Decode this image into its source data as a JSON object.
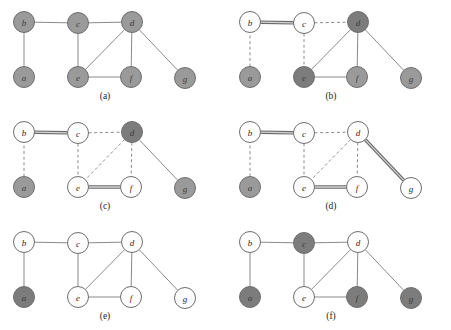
{
  "figure": {
    "panel_count": 6,
    "colors": {
      "node_gray_light": "#9a9a9a",
      "node_gray_dark": "#7c7c7c",
      "node_white": "#fdfdfd",
      "node_border": "#6e6e6e",
      "edge": "#8a8a8a",
      "bold_edge_outer": "#6a6a6a",
      "bold_edge_inner": "#d4d4d4",
      "text": "#242424",
      "background": "#ffffff"
    },
    "node_radius": 10.5,
    "layout": {
      "a": {
        "x": 24,
        "y": 77
      },
      "b": {
        "x": 24,
        "y": 22
      },
      "c": {
        "x": 78,
        "y": 23
      },
      "d": {
        "x": 132,
        "y": 22
      },
      "e": {
        "x": 78,
        "y": 77
      },
      "f": {
        "x": 131,
        "y": 77
      },
      "g": {
        "x": 185,
        "y": 78
      }
    },
    "edge_list": [
      [
        "b",
        "c"
      ],
      [
        "c",
        "d"
      ],
      [
        "a",
        "b"
      ],
      [
        "c",
        "e"
      ],
      [
        "d",
        "e"
      ],
      [
        "d",
        "f"
      ],
      [
        "d",
        "g"
      ],
      [
        "e",
        "f"
      ]
    ],
    "caption_position": {
      "x": 105,
      "y": 99
    }
  },
  "panels": [
    {
      "id": "panel-a",
      "caption": "(a)",
      "origin": {
        "x": 0,
        "y": 0
      },
      "nodes": [
        {
          "id": "a",
          "label": "a",
          "fill": "gray-light"
        },
        {
          "id": "b",
          "label": "b",
          "fill": "gray-light"
        },
        {
          "id": "c",
          "label": "c",
          "fill": "gray-light"
        },
        {
          "id": "d",
          "label": "d",
          "fill": "gray-light"
        },
        {
          "id": "e",
          "label": "e",
          "fill": "gray-light"
        },
        {
          "id": "f",
          "label": "f",
          "fill": "gray-light"
        },
        {
          "id": "g",
          "label": "g",
          "fill": "gray-light"
        }
      ],
      "edges": [
        {
          "from": "b",
          "to": "c",
          "style": "solid"
        },
        {
          "from": "c",
          "to": "d",
          "style": "solid"
        },
        {
          "from": "a",
          "to": "b",
          "style": "solid"
        },
        {
          "from": "c",
          "to": "e",
          "style": "solid"
        },
        {
          "from": "d",
          "to": "e",
          "style": "solid"
        },
        {
          "from": "d",
          "to": "f",
          "style": "solid"
        },
        {
          "from": "d",
          "to": "g",
          "style": "solid"
        },
        {
          "from": "e",
          "to": "f",
          "style": "solid"
        }
      ]
    },
    {
      "id": "panel-b",
      "caption": "(b)",
      "origin": {
        "x": 226,
        "y": 0
      },
      "nodes": [
        {
          "id": "a",
          "label": "a",
          "fill": "gray-light"
        },
        {
          "id": "b",
          "label": "b",
          "fill": "white"
        },
        {
          "id": "c",
          "label": "c",
          "fill": "white"
        },
        {
          "id": "d",
          "label": "d",
          "fill": "gray-dark"
        },
        {
          "id": "e",
          "label": "e",
          "fill": "gray-dark"
        },
        {
          "id": "f",
          "label": "f",
          "fill": "gray-light"
        },
        {
          "id": "g",
          "label": "g",
          "fill": "gray-light"
        }
      ],
      "edges": [
        {
          "from": "b",
          "to": "c",
          "style": "bold"
        },
        {
          "from": "c",
          "to": "d",
          "style": "dashed"
        },
        {
          "from": "a",
          "to": "b",
          "style": "dashed"
        },
        {
          "from": "c",
          "to": "e",
          "style": "dashed"
        },
        {
          "from": "d",
          "to": "e",
          "style": "solid"
        },
        {
          "from": "d",
          "to": "f",
          "style": "solid"
        },
        {
          "from": "d",
          "to": "g",
          "style": "solid"
        },
        {
          "from": "e",
          "to": "f",
          "style": "solid"
        }
      ]
    },
    {
      "id": "panel-c",
      "caption": "(c)",
      "origin": {
        "x": 0,
        "y": 110
      },
      "nodes": [
        {
          "id": "a",
          "label": "a",
          "fill": "gray-light"
        },
        {
          "id": "b",
          "label": "b",
          "fill": "white"
        },
        {
          "id": "c",
          "label": "c",
          "fill": "white"
        },
        {
          "id": "d",
          "label": "d",
          "fill": "gray-dark"
        },
        {
          "id": "e",
          "label": "e",
          "fill": "white"
        },
        {
          "id": "f",
          "label": "f",
          "fill": "white"
        },
        {
          "id": "g",
          "label": "g",
          "fill": "gray-light"
        }
      ],
      "edges": [
        {
          "from": "b",
          "to": "c",
          "style": "bold"
        },
        {
          "from": "c",
          "to": "d",
          "style": "dashed"
        },
        {
          "from": "a",
          "to": "b",
          "style": "dashed"
        },
        {
          "from": "c",
          "to": "e",
          "style": "dashed"
        },
        {
          "from": "d",
          "to": "e",
          "style": "dashed"
        },
        {
          "from": "d",
          "to": "f",
          "style": "dashed"
        },
        {
          "from": "d",
          "to": "g",
          "style": "solid"
        },
        {
          "from": "e",
          "to": "f",
          "style": "bold"
        }
      ]
    },
    {
      "id": "panel-d",
      "caption": "(d)",
      "origin": {
        "x": 226,
        "y": 110
      },
      "nodes": [
        {
          "id": "a",
          "label": "a",
          "fill": "gray-light"
        },
        {
          "id": "b",
          "label": "b",
          "fill": "white"
        },
        {
          "id": "c",
          "label": "c",
          "fill": "white"
        },
        {
          "id": "d",
          "label": "d",
          "fill": "white"
        },
        {
          "id": "e",
          "label": "e",
          "fill": "white"
        },
        {
          "id": "f",
          "label": "f",
          "fill": "white"
        },
        {
          "id": "g",
          "label": "g",
          "fill": "white"
        }
      ],
      "edges": [
        {
          "from": "b",
          "to": "c",
          "style": "bold"
        },
        {
          "from": "c",
          "to": "d",
          "style": "dashed"
        },
        {
          "from": "a",
          "to": "b",
          "style": "dashed"
        },
        {
          "from": "c",
          "to": "e",
          "style": "dashed"
        },
        {
          "from": "d",
          "to": "e",
          "style": "dashed"
        },
        {
          "from": "d",
          "to": "f",
          "style": "dashed"
        },
        {
          "from": "d",
          "to": "g",
          "style": "bold"
        },
        {
          "from": "e",
          "to": "f",
          "style": "bold"
        }
      ]
    },
    {
      "id": "panel-e",
      "caption": "(e)",
      "origin": {
        "x": 0,
        "y": 220
      },
      "nodes": [
        {
          "id": "a",
          "label": "a",
          "fill": "gray-dark"
        },
        {
          "id": "b",
          "label": "b",
          "fill": "white"
        },
        {
          "id": "c",
          "label": "c",
          "fill": "white"
        },
        {
          "id": "d",
          "label": "d",
          "fill": "white"
        },
        {
          "id": "e",
          "label": "e",
          "fill": "white"
        },
        {
          "id": "f",
          "label": "f",
          "fill": "white"
        },
        {
          "id": "g",
          "label": "g",
          "fill": "white"
        }
      ],
      "edges": [
        {
          "from": "b",
          "to": "c",
          "style": "solid"
        },
        {
          "from": "c",
          "to": "d",
          "style": "solid"
        },
        {
          "from": "a",
          "to": "b",
          "style": "solid"
        },
        {
          "from": "c",
          "to": "e",
          "style": "solid"
        },
        {
          "from": "d",
          "to": "e",
          "style": "solid"
        },
        {
          "from": "d",
          "to": "f",
          "style": "solid"
        },
        {
          "from": "d",
          "to": "g",
          "style": "solid"
        },
        {
          "from": "e",
          "to": "f",
          "style": "solid"
        }
      ]
    },
    {
      "id": "panel-f",
      "caption": "(f)",
      "origin": {
        "x": 226,
        "y": 220
      },
      "nodes": [
        {
          "id": "a",
          "label": "a",
          "fill": "gray-dark"
        },
        {
          "id": "b",
          "label": "b",
          "fill": "white"
        },
        {
          "id": "c",
          "label": "c",
          "fill": "gray-dark"
        },
        {
          "id": "d",
          "label": "d",
          "fill": "white"
        },
        {
          "id": "e",
          "label": "e",
          "fill": "white"
        },
        {
          "id": "f",
          "label": "f",
          "fill": "gray-dark"
        },
        {
          "id": "g",
          "label": "g",
          "fill": "gray-dark"
        }
      ],
      "edges": [
        {
          "from": "b",
          "to": "c",
          "style": "solid"
        },
        {
          "from": "c",
          "to": "d",
          "style": "solid"
        },
        {
          "from": "a",
          "to": "b",
          "style": "solid"
        },
        {
          "from": "c",
          "to": "e",
          "style": "solid"
        },
        {
          "from": "d",
          "to": "e",
          "style": "solid"
        },
        {
          "from": "d",
          "to": "f",
          "style": "solid"
        },
        {
          "from": "d",
          "to": "g",
          "style": "solid"
        },
        {
          "from": "e",
          "to": "f",
          "style": "solid"
        }
      ]
    }
  ]
}
